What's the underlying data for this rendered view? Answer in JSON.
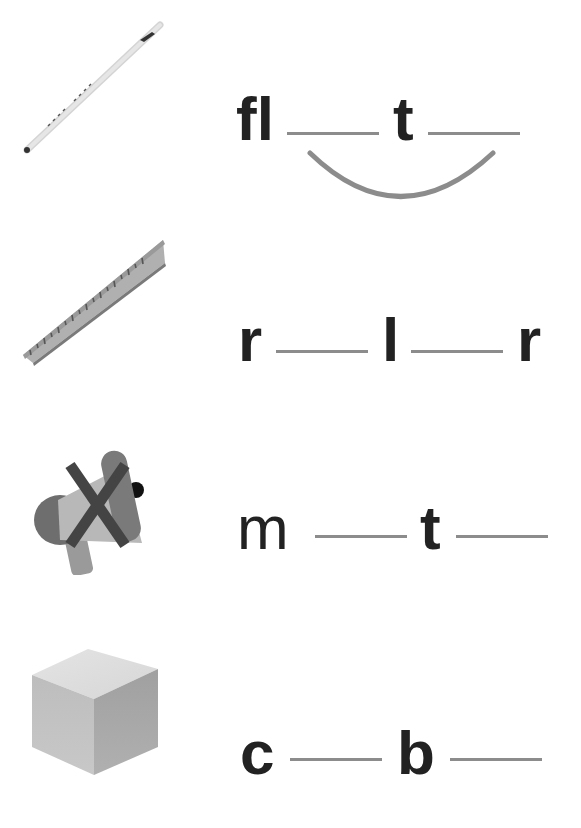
{
  "worksheet": {
    "rows": [
      {
        "picture": "flute-icon",
        "letters": [
          "fl",
          "t"
        ],
        "blanks": 2,
        "connector_arc": true
      },
      {
        "picture": "ruler-icon",
        "letters": [
          "r",
          "l",
          "r"
        ],
        "blanks": 2,
        "connector_arc": false
      },
      {
        "picture": "mute-megaphone-icon",
        "letters": [
          "m",
          "t"
        ],
        "blanks": 2,
        "connector_arc": false
      },
      {
        "picture": "cube-icon",
        "letters": [
          "c",
          "b"
        ],
        "blanks": 2,
        "connector_arc": false
      }
    ]
  },
  "colors": {
    "text": "#222222",
    "blank_line": "#8c8c8c",
    "arc": "#8c8c8c"
  }
}
